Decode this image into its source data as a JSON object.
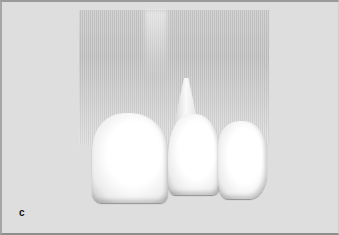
{
  "figure": {
    "panel_label": "c",
    "colors": {
      "background": "#dedede",
      "gingiva": "#c6c6c6",
      "tooth": "#ffffff",
      "border": "#9a9a9a"
    }
  }
}
